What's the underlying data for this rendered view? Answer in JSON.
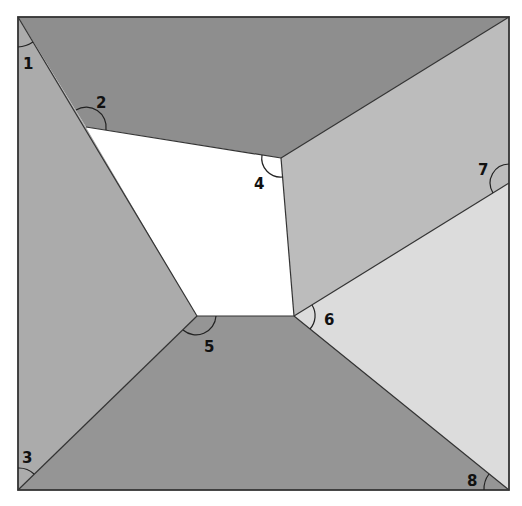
{
  "diagram": {
    "type": "tiled-square-angles",
    "colors": {
      "top": "#8e8e8e",
      "left": "#ababab",
      "right_upper": "#bcbcbc",
      "right_lower": "#dcdcdc",
      "bottom": "#959595",
      "center": "#ffffff",
      "border": "#333333"
    },
    "angle_labels": [
      {
        "id": "1",
        "text": "1"
      },
      {
        "id": "2",
        "text": "2"
      },
      {
        "id": "3",
        "text": "3"
      },
      {
        "id": "4",
        "text": "4"
      },
      {
        "id": "5",
        "text": "5"
      },
      {
        "id": "6",
        "text": "6"
      },
      {
        "id": "7",
        "text": "7"
      },
      {
        "id": "8",
        "text": "8"
      }
    ]
  }
}
